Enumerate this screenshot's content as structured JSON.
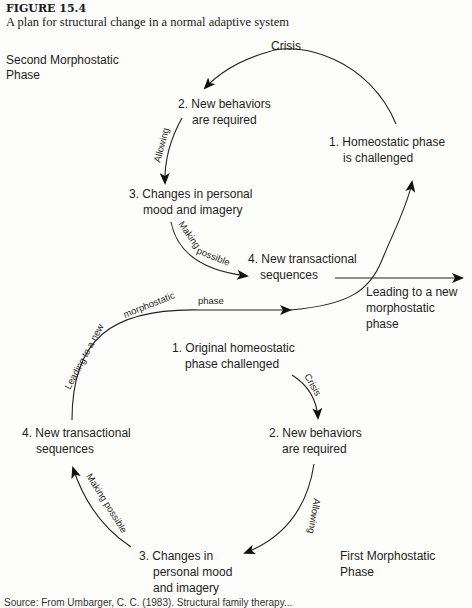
{
  "figure": {
    "number": "FIGURE 15.4",
    "caption": "A plan for structural change in a normal adaptive system"
  },
  "second_phase": {
    "title_line1": "Second Morphostatic",
    "title_line2": "Phase",
    "step1_l1": "1. Homeostatic phase",
    "step1_l2": "is challenged",
    "step2_l1": "2. New behaviors",
    "step2_l2": "are required",
    "step3_l1": "3. Changes in personal",
    "step3_l2": "mood and imagery",
    "step4_l1": "4. New transactional",
    "step4_l2": "sequences",
    "edge_crisis": "Crisis",
    "edge_allowing": "Allowing",
    "edge_making_possible": "Making possible",
    "exit_l1": "Leading to a new",
    "exit_l2": "morphostatic",
    "exit_l3": "phase"
  },
  "first_phase": {
    "title_line1": "First Morphostatic",
    "title_line2": "Phase",
    "step1_l1": "1. Original homeostatic",
    "step1_l2": "phase challenged",
    "step2_l1": "2. New behaviors",
    "step2_l2": "are required",
    "step3_l1": "3. Changes in",
    "step3_l2": "personal mood",
    "step3_l3": "and imagery",
    "step4_l1": "4. New transactional",
    "step4_l2": "sequences",
    "edge_crisis": "Crisis",
    "edge_allowing": "Allowing",
    "edge_making_possible": "Making possible",
    "edge_leading": "Leading to a new morphostatic phase"
  },
  "source_text": "Source: From Umbarger, C. C. (1983). Structural family therapy..."
}
